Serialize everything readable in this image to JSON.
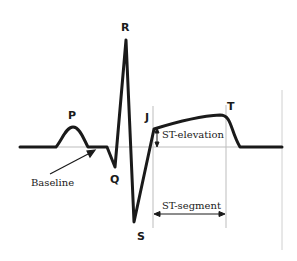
{
  "diagram": {
    "wave_labels": {
      "P": "P",
      "Q": "Q",
      "R": "R",
      "S": "S",
      "J": "J",
      "T": "T"
    },
    "annotations": {
      "baseline": "Baseline",
      "st_elevation": "ST-elevation",
      "st_segment": "ST-segment"
    },
    "colors": {
      "trace": "#1a1a1a",
      "guide": "#bdbdbd",
      "background": "#ffffff"
    }
  }
}
